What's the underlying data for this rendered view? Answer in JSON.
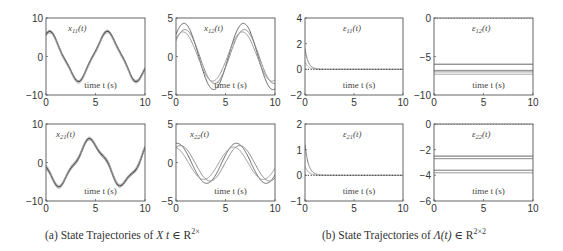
{
  "chart_data": [
    {
      "id": "x11",
      "type": "line",
      "title": "x11(t)",
      "title_main": "x",
      "title_sub": "11",
      "xlabel": "time t (s)",
      "xlim": [
        0,
        10
      ],
      "ylim": [
        -10,
        10
      ],
      "xticks": [
        0,
        5,
        10
      ],
      "yticks": [
        -10,
        0,
        10
      ],
      "frame": [
        46,
        18,
        145,
        95
      ],
      "series": [
        {
          "name": "trace1",
          "color": "#555",
          "width": 1.3,
          "kind": "wave",
          "offset": 0,
          "amp": [
            6,
            -6
          ],
          "desc": "starts ~5.5, peaks 6 at t≈0.3, trough -6 at t≈3.5, peak 6 at t≈6.2, down to ~-5 at t=10"
        },
        {
          "name": "trace2",
          "color": "#888",
          "width": 1.0,
          "kind": "wave",
          "offset": 0.3,
          "amp": [
            6,
            -6
          ]
        },
        {
          "name": "trace3",
          "color": "#aaa",
          "width": 1.0,
          "kind": "wave",
          "offset": -0.4,
          "amp": [
            6,
            -6
          ]
        }
      ]
    },
    {
      "id": "x12",
      "type": "line",
      "title": "x12(t)",
      "title_main": "x",
      "title_sub": "12",
      "xlabel": "time t (s)",
      "xlim": [
        0,
        10
      ],
      "ylim": [
        -5,
        5
      ],
      "xticks": [
        0,
        5,
        10
      ],
      "yticks": [
        -5,
        0,
        5
      ],
      "frame": [
        176,
        18,
        275,
        95
      ],
      "series": [
        {
          "name": "trace1",
          "color": "#666",
          "amp": 4.3,
          "phase": 0.0,
          "desc": "sinusoid amp ~4.3, peaks t≈0.8 and 6.8, trough t≈3.8"
        },
        {
          "name": "trace2",
          "color": "#888",
          "amp": 3.5,
          "phase": 0.1
        },
        {
          "name": "trace3",
          "color": "#999",
          "amp": 3.2,
          "phase": -0.1
        }
      ]
    },
    {
      "id": "eps11",
      "type": "line",
      "title": "ε11(t)",
      "title_main": "ε",
      "title_sub": "11",
      "xlabel": "time t (s)",
      "xlim": [
        0,
        10
      ],
      "ylim": [
        -2,
        4
      ],
      "xticks": [
        0,
        5,
        10
      ],
      "yticks": [
        -2,
        0,
        2,
        4
      ],
      "frame": [
        305,
        18,
        403,
        95
      ],
      "series": [
        {
          "name": "decay1",
          "color": "#888",
          "start": 1.6,
          "rate": 3.0,
          "desc": "exponential decay from ~1.6 to 0 by t≈1"
        },
        {
          "name": "decay2",
          "color": "#aaa",
          "start": 0.6,
          "rate": 3.0
        },
        {
          "name": "zero",
          "color": "#333",
          "const": 0,
          "dotted": true
        }
      ]
    },
    {
      "id": "eps12",
      "type": "line",
      "title": "ε12(t)",
      "title_main": "ε",
      "title_sub": "12",
      "xlabel": "time t (s)",
      "xlim": [
        0,
        10
      ],
      "ylim": [
        -10,
        0
      ],
      "xticks": [
        0,
        5,
        10
      ],
      "yticks": [
        -10,
        -5,
        0
      ],
      "frame": [
        434,
        18,
        533,
        95
      ],
      "series": [
        {
          "name": "c0",
          "color": "#333",
          "const": 0,
          "dotted": true
        },
        {
          "name": "c1",
          "color": "#666",
          "const": -6.0
        },
        {
          "name": "c2",
          "color": "#888",
          "const": -6.8
        },
        {
          "name": "c3",
          "color": "#999",
          "const": -7.0
        },
        {
          "name": "c4",
          "color": "#aaa",
          "const": -7.3
        }
      ]
    },
    {
      "id": "x21",
      "type": "line",
      "title": "x21(t)",
      "title_main": "x",
      "title_sub": "21",
      "xlabel": "time t (s)",
      "xlim": [
        0,
        10
      ],
      "ylim": [
        -10,
        10
      ],
      "xticks": [
        0,
        5,
        10
      ],
      "yticks": [
        -10,
        0,
        10
      ],
      "frame": [
        46,
        124,
        145,
        201
      ],
      "series": [
        {
          "name": "trace1",
          "color": "#555",
          "width": 1.3,
          "offset": 0,
          "desc": "starts ~4, trough -5 at t≈1.3, peak ~6 at t≈4.5, trough -5 at t≈7.8, rising to ~1 at t=10"
        },
        {
          "name": "trace2",
          "color": "#888",
          "offset": -0.5
        },
        {
          "name": "trace3",
          "color": "#aaa",
          "offset": 0.5
        }
      ]
    },
    {
      "id": "x22",
      "type": "line",
      "title": "x22(t)",
      "title_main": "x",
      "title_sub": "22",
      "xlabel": "time t (s)",
      "xlim": [
        0,
        10
      ],
      "ylim": [
        -5,
        5
      ],
      "xticks": [
        0,
        5,
        10
      ],
      "yticks": [
        -5,
        0,
        5
      ],
      "frame": [
        176,
        124,
        275,
        201
      ],
      "series": [
        {
          "name": "trace1",
          "color": "#666",
          "amp": 2.6,
          "phase": 0.0,
          "desc": "sinusoid amp ~2.5, starts ~2.5, trough t≈3, peak t≈6"
        },
        {
          "name": "trace2",
          "color": "#888",
          "amp": 2.3,
          "phase": 0.35
        },
        {
          "name": "trace3",
          "color": "#999",
          "amp": 2.1,
          "phase": -0.3
        }
      ]
    },
    {
      "id": "eps21",
      "type": "line",
      "title": "ε21(t)",
      "title_main": "ε",
      "title_sub": "21",
      "xlabel": "time t (s)",
      "xlim": [
        0,
        10
      ],
      "ylim": [
        -1,
        2
      ],
      "xticks": [
        0,
        5,
        10
      ],
      "yticks": [
        -1,
        0,
        1,
        2
      ],
      "frame": [
        305,
        124,
        403,
        201
      ],
      "series": [
        {
          "name": "decay1",
          "color": "#888",
          "start": 1.2,
          "rate": 2.8
        },
        {
          "name": "decay2",
          "color": "#aaa",
          "start": 0.35,
          "rate": 2.8
        },
        {
          "name": "zero",
          "color": "#333",
          "const": 0,
          "dotted": true
        }
      ]
    },
    {
      "id": "eps22",
      "type": "line",
      "title": "ε22(t)",
      "title_main": "ε",
      "title_sub": "22",
      "xlabel": "time t (s)",
      "xlim": [
        0,
        10
      ],
      "ylim": [
        -6,
        0
      ],
      "xticks": [
        0,
        5,
        10
      ],
      "yticks": [
        -6,
        -4,
        -2,
        0
      ],
      "frame": [
        434,
        124,
        533,
        201
      ],
      "series": [
        {
          "name": "c0",
          "color": "#333",
          "const": 0,
          "dotted": true
        },
        {
          "name": "c1",
          "color": "#666",
          "const": -2.5
        },
        {
          "name": "c2",
          "color": "#888",
          "const": -2.7
        },
        {
          "name": "c3",
          "color": "#777",
          "const": -3.6
        },
        {
          "name": "c4",
          "color": "#999",
          "const": -3.8
        }
      ]
    }
  ],
  "captions": {
    "a": {
      "prefix": "(a) State Trajectories of ",
      "var": "X",
      "mid": " t ",
      "in": "∈ R",
      "sup": "2×"
    },
    "b": {
      "prefix": "(b) State Trajectories of ",
      "var": "Λ(t)",
      "in": " ∈ R",
      "sup": "2×2"
    }
  }
}
